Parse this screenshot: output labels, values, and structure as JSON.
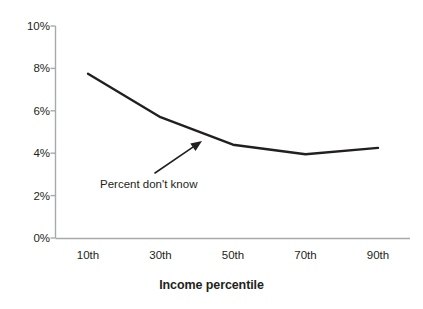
{
  "chart_data": {
    "type": "line",
    "title": "",
    "subtitle": "",
    "xlabel": "Income percentile",
    "ylabel": "",
    "categories": [
      "10th",
      "30th",
      "50th",
      "70th",
      "90th"
    ],
    "series": [
      {
        "name": "Percent don't know",
        "values": [
          7.75,
          5.7,
          4.4,
          3.95,
          4.25
        ]
      }
    ],
    "ytick_labels": [
      "10%",
      "8%",
      "6%",
      "4%",
      "2%",
      "0%"
    ],
    "ytick_values": [
      10,
      8,
      6,
      4,
      2,
      0
    ],
    "ylim": [
      0,
      10
    ],
    "xlim_categories": [
      10,
      90
    ],
    "grid": false,
    "legend_position": "none",
    "annotations": [
      {
        "name": "percent-dont-know",
        "text": "Percent don't know",
        "arrow_from_x": 155,
        "arrow_from_y": 173,
        "arrow_to_x": 202,
        "arrow_to_y": 141
      }
    ],
    "colors": {
      "series_line": "#231f20",
      "axis": "#a7a9ac",
      "text": "#231f20",
      "background": "#ffffff"
    }
  },
  "axes": {
    "y_axis_name": "percent-axis",
    "x_axis_name": "income-percentile-axis"
  }
}
